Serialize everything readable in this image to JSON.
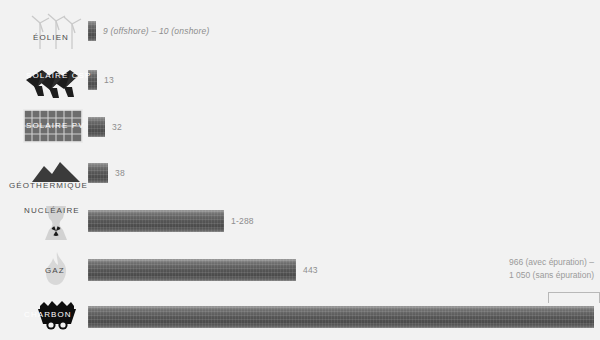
{
  "background_color": "#f2f2f2",
  "bar_color_dark": "#4a4a4a",
  "bar_color_light": "#9a9a9a",
  "label_color": "#4a4a4a",
  "value_color": "#8d8d8d",
  "rows": [
    {
      "key": "eolien",
      "label": "ÉOLIEN",
      "icon": "wind-turbine-icon",
      "value_text": "9 (offshore) – 10 (onshore)",
      "value_italic": true,
      "bar_width_px": 8
    },
    {
      "key": "solaire-csp",
      "label": "SOLAIRE CSP",
      "icon": "solar-csp-mirror-icon",
      "value_text": "13",
      "value_italic": false,
      "bar_width_px": 9
    },
    {
      "key": "solaire-pv",
      "label": "SOLAIRE PV",
      "icon": "solar-pv-panel-icon",
      "value_text": "32",
      "value_italic": false,
      "bar_width_px": 17
    },
    {
      "key": "geothermique",
      "label": "GÉOTHERMIQUE",
      "icon": "geothermal-mountain-icon",
      "value_text": "38",
      "value_italic": false,
      "bar_width_px": 20
    },
    {
      "key": "nucleaire",
      "label": "NUCLÉAIRE",
      "icon": "nuclear-cooling-tower-icon",
      "value_text": "1-288",
      "value_italic": false,
      "bar_width_px": 136
    },
    {
      "key": "gaz",
      "label": "GAZ",
      "icon": "gas-flame-icon",
      "value_text": "443",
      "value_italic": false,
      "bar_width_px": 208
    },
    {
      "key": "charbon",
      "label": "CHARBON",
      "icon": "coal-cart-icon",
      "value_text": "",
      "value_italic": false,
      "bar_width_px": 506
    }
  ],
  "coal_annotation": {
    "line1": "966 (avec épuration) –",
    "line2": "1 050 (sans épuration)"
  },
  "chart_data": {
    "type": "bar",
    "orientation": "horizontal",
    "title": "",
    "xlabel": "",
    "ylabel": "",
    "categories": [
      "ÉOLIEN",
      "SOLAIRE CSP",
      "SOLAIRE PV",
      "GÉOTHERMIQUE",
      "NUCLÉAIRE",
      "GAZ",
      "CHARBON"
    ],
    "values": [
      10,
      13,
      32,
      38,
      288,
      443,
      1050
    ],
    "value_labels": [
      "9 (offshore) – 10 (onshore)",
      "13",
      "32",
      "38",
      "1-288",
      "443",
      "966 (avec épuration) – 1 050 (sans épuration)"
    ],
    "ranges": [
      [
        9,
        10
      ],
      [
        13,
        13
      ],
      [
        32,
        32
      ],
      [
        38,
        38
      ],
      [
        1,
        288
      ],
      [
        443,
        443
      ],
      [
        966,
        1050
      ]
    ],
    "xlim": [
      0,
      1050
    ],
    "grid": false,
    "legend": false
  }
}
